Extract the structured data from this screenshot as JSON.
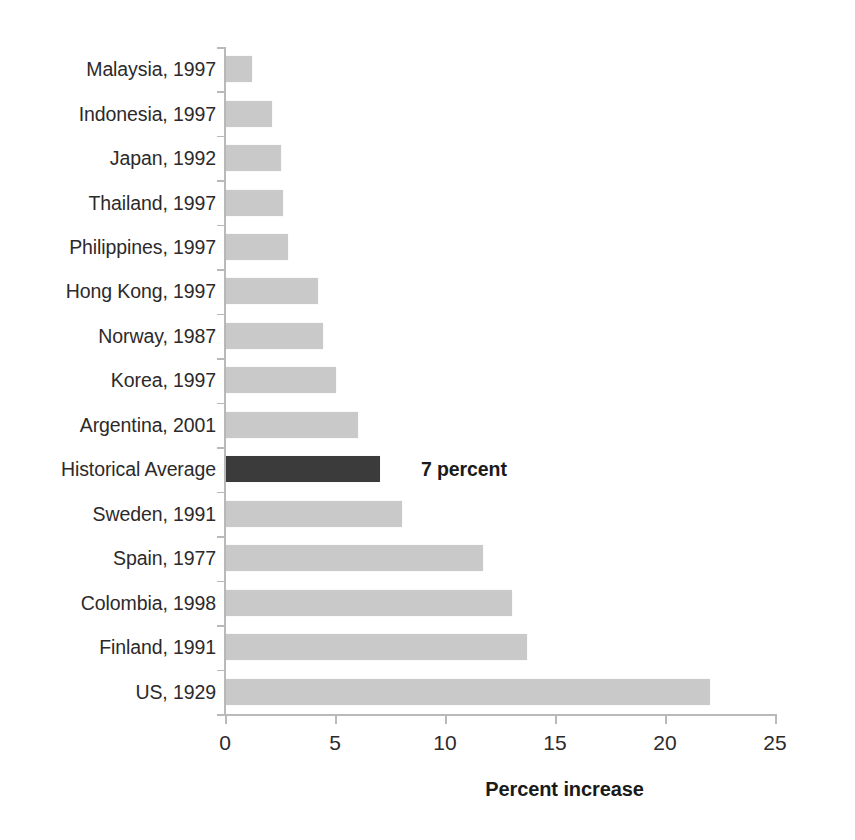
{
  "chart_data": {
    "type": "bar",
    "orientation": "horizontal",
    "title": "",
    "subtitle": "",
    "xlabel": "Percent increase",
    "ylabel": "",
    "xlim": [
      0,
      25
    ],
    "xticks": [
      0,
      5,
      10,
      15,
      20,
      25
    ],
    "xtick_labels": [
      "0",
      "5",
      "10",
      "15",
      "20",
      "25"
    ],
    "grid": false,
    "legend": null,
    "categories": [
      "Malaysia, 1997",
      "Indonesia, 1997",
      "Japan, 1992",
      "Thailand, 1997",
      "Philippines, 1997",
      "Hong Kong, 1997",
      "Norway, 1987",
      "Korea, 1997",
      "Argentina, 2001",
      "Historical Average",
      "Sweden, 1991",
      "Spain, 1977",
      "Colombia, 1998",
      "Finland, 1991",
      "US, 1929"
    ],
    "values": [
      1.2,
      2.1,
      2.5,
      2.6,
      2.8,
      4.2,
      4.4,
      5.0,
      6.0,
      7.0,
      8.0,
      11.7,
      13.0,
      13.7,
      22.0
    ],
    "highlight_index": 9,
    "annotations": [
      {
        "index": 9,
        "text": "7 percent"
      }
    ],
    "colors": {
      "bar": "#c9c9c9",
      "highlight_bar": "#3b3b3b",
      "axis": "#b9b9b9",
      "text": "#2c2a2b"
    }
  }
}
